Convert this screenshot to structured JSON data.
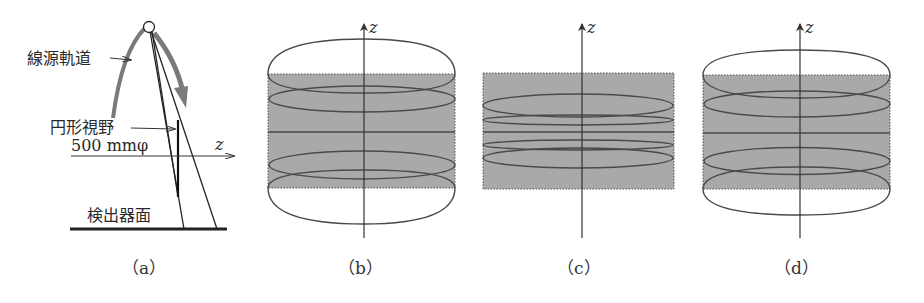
{
  "panel_a": {
    "source_orbit_label": "線源軌道",
    "fov_label": "円形視野",
    "fov_size": "500 mmφ",
    "axis_label": "z",
    "detector_label": "検出器面",
    "caption": "（a）"
  },
  "panel_b": {
    "axis_label": "z",
    "caption": "（b）"
  },
  "panel_c": {
    "axis_label": "z",
    "caption": "（c）"
  },
  "panel_d": {
    "axis_label": "z",
    "caption": "（d）"
  },
  "colors": {
    "fov_fill": "#a9a9a9",
    "orbit_gray": "#7a7a7a",
    "line": "#333333"
  }
}
